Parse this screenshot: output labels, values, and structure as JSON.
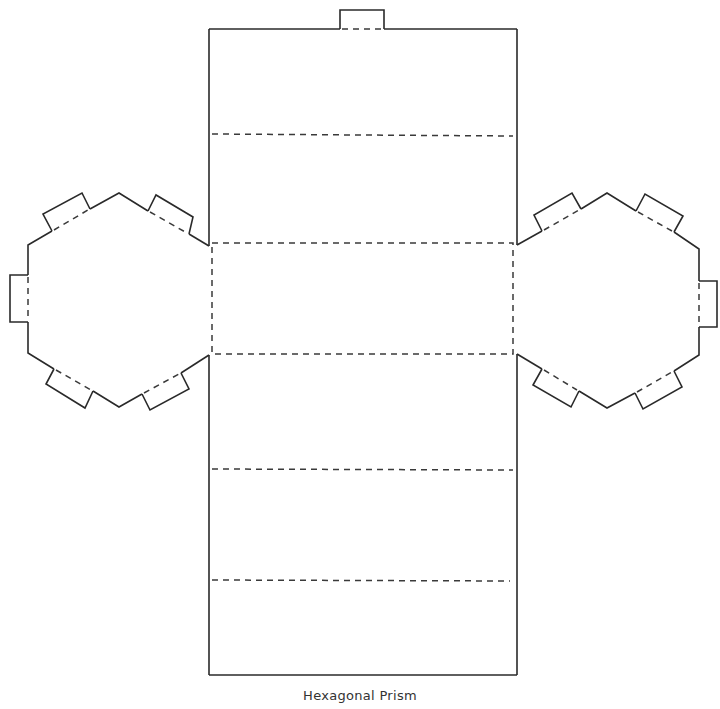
{
  "diagram": {
    "title": "Hexagonal Prism",
    "type": "net",
    "shape": "hexagonal-prism",
    "colors": {
      "background": "#ffffff",
      "cut_line": "#2a2a2a",
      "fold_line": "#3a3a3a",
      "caption": "#333333"
    },
    "legend": {
      "solid_line": "cut",
      "dashed_line": "fold"
    },
    "components": {
      "lateral_faces": 6,
      "hexagon_bases": 2,
      "glue_tabs": 13
    }
  },
  "caption": {
    "text": "Hexagonal Prism"
  }
}
